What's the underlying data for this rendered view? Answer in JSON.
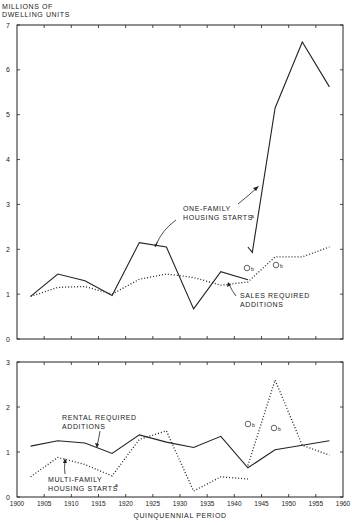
{
  "y_axis_title_line1": "MILLIONS OF",
  "y_axis_title_line2": "DWELLING UNITS",
  "x_axis_title": "QUINQUENNIAL PERIOD",
  "top_labels": {
    "one_family_1": "ONE-FAMILY",
    "one_family_2": "HOUSING STARTS",
    "one_family_sup": "a",
    "sales_1": "SALES REQUIRED",
    "sales_2": "ADDITIONS",
    "b1": "b",
    "b2": "b"
  },
  "bottom_labels": {
    "rental_1": "RENTAL REQUIRED",
    "rental_2": "ADDITIONS",
    "multi_1": "MULTI-FAMILY",
    "multi_2": "HOUSING STARTS",
    "multi_sup": "a",
    "b1": "b",
    "b2": "b"
  },
  "chart_data": [
    {
      "type": "line",
      "panel": "top",
      "title": "",
      "ylabel": "MILLIONS OF DWELLING UNITS",
      "xlabel": "",
      "ylim": [
        0,
        7
      ],
      "xlim": [
        1900,
        1960
      ],
      "yticks": [
        "0",
        "1",
        "2",
        "3",
        "4",
        "5",
        "6",
        "7"
      ],
      "series": [
        {
          "name": "ONE-FAMILY HOUSING STARTS a",
          "style": "solid",
          "x": [
            1902.5,
            1907.5,
            1912.5,
            1917.5,
            1922.5,
            1927.5,
            1932.5,
            1937.5,
            1942.5
          ],
          "values": [
            0.95,
            1.45,
            1.3,
            0.97,
            2.15,
            2.05,
            0.67,
            1.5,
            1.32
          ]
        },
        {
          "name": "ONE-FAMILY HOUSING STARTS a (new series)",
          "style": "solid",
          "x": [
            1942.5,
            1943.3,
            1945.3,
            1947.5,
            1952.5,
            1957.5
          ],
          "values": [
            2.05,
            1.93,
            3.45,
            5.15,
            6.62,
            5.62
          ]
        },
        {
          "name": "SALES REQUIRED ADDITIONS",
          "style": "dotted",
          "x": [
            1902.5,
            1907.5,
            1912.5,
            1917.5,
            1922.5,
            1927.5,
            1932.5,
            1937.5,
            1942.5,
            1947.5,
            1952.5,
            1957.5
          ],
          "values": [
            0.95,
            1.15,
            1.17,
            1.0,
            1.33,
            1.45,
            1.37,
            1.2,
            1.27,
            1.83,
            1.83,
            2.05
          ]
        }
      ],
      "annotations": [
        "ONE-FAMILY HOUSING STARTS a",
        "SALES REQUIRED ADDITIONS",
        "⊙b",
        "⊙b"
      ]
    },
    {
      "type": "line",
      "panel": "bottom",
      "xlabel": "QUINQUENNIAL PERIOD",
      "ylim": [
        0,
        3
      ],
      "xlim": [
        1900,
        1960
      ],
      "yticks": [
        "0",
        "1",
        "2",
        "3"
      ],
      "xticks": [
        "1900",
        "1905",
        "1910",
        "1915",
        "1920",
        "1925",
        "1930",
        "1935",
        "1940",
        "1945",
        "1950",
        "1955",
        "1960"
      ],
      "series": [
        {
          "name": "RENTAL REQUIRED ADDITIONS",
          "style": "solid",
          "x": [
            1902.5,
            1907.5,
            1912.5,
            1917.5,
            1922.5,
            1927.5,
            1932.5,
            1937.5,
            1942.5,
            1947.5,
            1952.5,
            1957.5
          ],
          "values": [
            1.13,
            1.25,
            1.2,
            0.97,
            1.38,
            1.22,
            1.1,
            1.35,
            0.65,
            1.05,
            1.15,
            1.25
          ]
        },
        {
          "name": "MULTI-FAMILY HOUSING STARTS a",
          "style": "dotted",
          "x": [
            1902.5,
            1907.5,
            1912.5,
            1917.5,
            1922.5,
            1927.5,
            1932.5,
            1937.5,
            1942.5
          ],
          "values": [
            0.45,
            0.88,
            0.72,
            0.47,
            1.28,
            1.47,
            0.13,
            0.45,
            0.4
          ]
        },
        {
          "name": "MULTI-FAMILY HOUSING STARTS a (new series)",
          "style": "dotted",
          "x": [
            1942.5,
            1947.5,
            1952.5,
            1957.5
          ],
          "values": [
            0.7,
            2.6,
            1.15,
            0.93
          ]
        }
      ],
      "annotations": [
        "RENTAL REQUIRED ADDITIONS",
        "MULTI-FAMILY HOUSING STARTS a",
        "⊙b",
        "⊙b"
      ]
    }
  ]
}
